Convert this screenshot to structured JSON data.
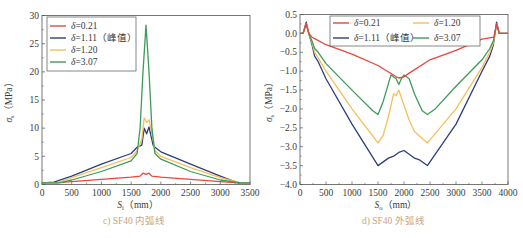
{
  "colors": {
    "d021": "#e8473a",
    "d111": "#2c3f7f",
    "d120": "#f3c05a",
    "d307": "#3e9a5c",
    "axis": "#555555",
    "caption": "#c9a383"
  },
  "captions": {
    "left": "c) SF40 内弧线",
    "right": "d) SF40 外弧线"
  },
  "chart_data": [
    {
      "type": "line",
      "title": "c) SF40 内弧线",
      "xlabel": "S_i (mm)",
      "ylabel": "σ_s (MPa)",
      "xlim": [
        0,
        3500
      ],
      "ylim": [
        0,
        30
      ],
      "xticks": [
        0,
        500,
        1000,
        1500,
        2000,
        2500,
        3000,
        3500
      ],
      "yticks": [
        0,
        5,
        10,
        15,
        20,
        25,
        30
      ],
      "grid": false,
      "legend_position": "upper-left",
      "series": [
        {
          "name": "δ=0.21",
          "color": "#e8473a",
          "x": [
            0,
            200,
            500,
            1000,
            1500,
            1650,
            1700,
            1750,
            1800,
            1850,
            2000,
            2500,
            3000,
            3300,
            3500
          ],
          "y": [
            0.3,
            0.3,
            0.5,
            0.9,
            1.3,
            1.5,
            2.0,
            1.8,
            2.0,
            1.5,
            1.3,
            0.9,
            0.5,
            0.3,
            0.3
          ]
        },
        {
          "name": "δ=1.11（峰值）",
          "color": "#2c3f7f",
          "x": [
            0,
            200,
            500,
            1000,
            1500,
            1600,
            1680,
            1720,
            1760,
            1800,
            1870,
            1900,
            2000,
            2500,
            3000,
            3300,
            3500
          ],
          "y": [
            0.3,
            0.4,
            1.5,
            3.6,
            5.5,
            6.6,
            7.0,
            10.0,
            9.0,
            10.2,
            7.0,
            6.6,
            5.8,
            3.6,
            1.5,
            0.3,
            0.3
          ]
        },
        {
          "name": "δ=1.20",
          "color": "#f3c05a",
          "x": [
            0,
            250,
            500,
            1000,
            1500,
            1600,
            1680,
            1720,
            1760,
            1800,
            1870,
            1900,
            2000,
            2500,
            3000,
            3350,
            3500
          ],
          "y": [
            0.3,
            0.3,
            1.2,
            3.0,
            4.8,
            6.0,
            8.0,
            11.8,
            11.0,
            11.5,
            8.0,
            6.0,
            5.0,
            3.0,
            1.2,
            0.3,
            0.3
          ]
        },
        {
          "name": "δ=3.07",
          "color": "#3e9a5c",
          "x": [
            0,
            300,
            500,
            1000,
            1500,
            1600,
            1650,
            1700,
            1750,
            1800,
            1850,
            1900,
            2000,
            2500,
            3000,
            3350,
            3500
          ],
          "y": [
            0.3,
            0.3,
            0.8,
            2.3,
            4.2,
            5.5,
            10.0,
            20.0,
            28.3,
            20.0,
            10.0,
            5.5,
            4.5,
            2.3,
            0.8,
            0.3,
            0.3
          ]
        }
      ]
    },
    {
      "type": "line",
      "title": "d) SF40 外弧线",
      "xlabel": "S_o (mm)",
      "ylabel": "σ_s (MPa)",
      "xlim": [
        0,
        4000
      ],
      "ylim": [
        -4.0,
        0.5
      ],
      "xticks": [
        0,
        500,
        1000,
        1500,
        2000,
        2500,
        3000,
        3500,
        4000
      ],
      "yticks": [
        0.5,
        0.0,
        -0.5,
        -1.0,
        -1.5,
        -2.0,
        -2.5,
        -3.0,
        -3.5,
        -4.0
      ],
      "grid": false,
      "legend_position": "upper-center (2 columns)",
      "series": [
        {
          "name": "δ=0.21",
          "color": "#e8473a",
          "x": [
            0,
            60,
            120,
            170,
            230,
            300,
            500,
            1000,
            1500,
            1850,
            1900,
            2000,
            2100,
            2500,
            3000,
            3500,
            3730,
            3780,
            3830,
            3880,
            3940,
            4000
          ],
          "y": [
            0.0,
            0.0,
            0.25,
            0.0,
            -0.1,
            -0.15,
            -0.3,
            -0.55,
            -0.85,
            -1.15,
            -1.18,
            -1.15,
            -1.05,
            -0.7,
            -0.45,
            -0.15,
            -0.1,
            0.25,
            0.0,
            0.0,
            0.0,
            0.0
          ]
        },
        {
          "name": "δ=1.11（峰值）",
          "color": "#2c3f7f",
          "x": [
            0,
            60,
            120,
            170,
            230,
            280,
            350,
            500,
            1000,
            1500,
            1700,
            1800,
            1900,
            2000,
            2100,
            2200,
            2300,
            2450,
            3000,
            3500,
            3650,
            3720,
            3780,
            3830,
            3880,
            3940,
            4000
          ],
          "y": [
            0.0,
            0.0,
            0.3,
            0.0,
            -0.3,
            -0.6,
            -0.75,
            -1.2,
            -2.4,
            -3.5,
            -3.3,
            -3.25,
            -3.15,
            -3.1,
            -3.2,
            -3.3,
            -3.35,
            -3.5,
            -2.4,
            -1.0,
            -0.6,
            -0.3,
            0.3,
            0.0,
            0.0,
            0.0,
            0.0
          ]
        },
        {
          "name": "δ=1.20",
          "color": "#f3c05a",
          "x": [
            0,
            60,
            120,
            170,
            230,
            280,
            350,
            500,
            1000,
            1500,
            1600,
            1700,
            1800,
            1850,
            1900,
            2000,
            2100,
            2200,
            2450,
            3000,
            3500,
            3650,
            3720,
            3780,
            3830,
            3880,
            3940,
            4000
          ],
          "y": [
            0.0,
            0.0,
            0.25,
            0.0,
            -0.25,
            -0.5,
            -0.65,
            -1.0,
            -2.0,
            -2.9,
            -2.7,
            -2.2,
            -1.6,
            -1.65,
            -1.5,
            -1.9,
            -2.3,
            -2.6,
            -2.9,
            -2.0,
            -0.9,
            -0.5,
            -0.25,
            0.25,
            0.0,
            0.0,
            0.0,
            0.0
          ]
        },
        {
          "name": "δ=3.07",
          "color": "#3e9a5c",
          "x": [
            0,
            60,
            120,
            170,
            230,
            280,
            350,
            500,
            1000,
            1400,
            1500,
            1600,
            1750,
            1850,
            1900,
            1950,
            2000,
            2100,
            2200,
            2350,
            2450,
            2600,
            3000,
            3500,
            3650,
            3720,
            3780,
            3830,
            3880,
            3940,
            4000
          ],
          "y": [
            0.0,
            0.0,
            0.25,
            0.0,
            -0.2,
            -0.4,
            -0.5,
            -0.8,
            -1.5,
            -2.05,
            -2.15,
            -1.8,
            -1.1,
            -1.2,
            -1.35,
            -1.2,
            -1.1,
            -1.2,
            -1.6,
            -2.05,
            -2.15,
            -2.0,
            -1.4,
            -0.7,
            -0.4,
            -0.2,
            0.25,
            0.0,
            0.0,
            0.0,
            0.0
          ]
        }
      ]
    }
  ],
  "left_chart": {
    "legend": [
      "δ=0.21",
      "δ=1.11（峰值）",
      "δ=1.20",
      "δ=3.07"
    ],
    "xlabel_main": "S",
    "xlabel_sub": "i",
    "xlabel_unit": "（mm）",
    "ylabel_main": "σ",
    "ylabel_sub": "s",
    "ylabel_unit": "（MPa）"
  },
  "right_chart": {
    "legend": [
      "δ=0.21",
      "δ=1.11（峰值）",
      "δ=1.20",
      "δ=3.07"
    ],
    "xlabel_main": "S",
    "xlabel_sub": "o",
    "xlabel_unit": "（mm）",
    "ylabel_main": "σ",
    "ylabel_sub": "s",
    "ylabel_unit": "（MPa）"
  }
}
